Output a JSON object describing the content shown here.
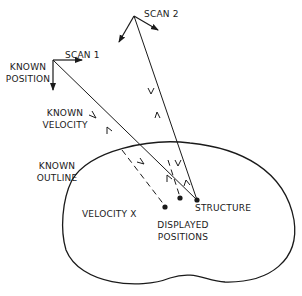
{
  "labels": {
    "scan1": "SCAN 1",
    "scan2": "SCAN 2",
    "known_position": [
      "KNOWN",
      "POSITION"
    ],
    "known_velocity": [
      "KNOWN",
      "VELOCITY"
    ],
    "known_outline": [
      "KNOWN",
      "OUTLINE"
    ],
    "velocity_x": "VELOCITY  X",
    "structure": "STRUCTURE",
    "displayed_positions": [
      "DISPLAYED",
      "POSITIONS"
    ]
  },
  "geometry": {
    "scan1_origin": [
      53,
      60
    ],
    "scan2_origin": [
      134,
      16
    ],
    "structure_point": [
      197,
      200
    ],
    "displayed_point_1": [
      165,
      207
    ],
    "displayed_point_2": [
      180,
      198
    ]
  },
  "colors": {
    "line": "#1a1a1a",
    "background": "#ffffff"
  }
}
